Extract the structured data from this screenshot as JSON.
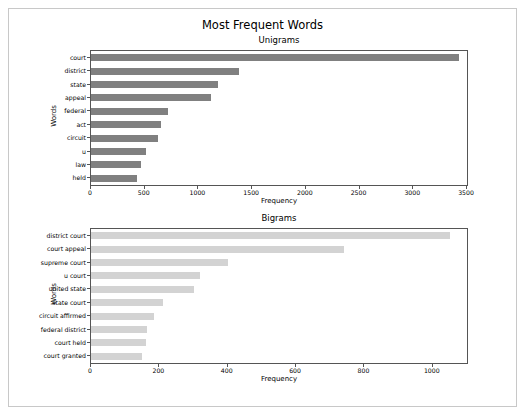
{
  "figure": {
    "suptitle": "Most Frequent Words"
  },
  "chart_data": [
    {
      "type": "bar",
      "orientation": "horizontal",
      "title": "Unigrams",
      "xlabel": "Frequency",
      "ylabel": "Words",
      "categories": [
        "court",
        "district",
        "state",
        "appeal",
        "federal",
        "act",
        "circuit",
        "u",
        "law",
        "held"
      ],
      "values": [
        3430,
        1380,
        1180,
        1120,
        720,
        650,
        620,
        510,
        470,
        430
      ],
      "xlim": [
        0,
        3500
      ],
      "xticks": [
        0,
        500,
        1000,
        1500,
        2000,
        2500,
        3000,
        3500
      ],
      "xticklabels": [
        "0",
        "500",
        "1000",
        "1500",
        "2000",
        "2500",
        "3000",
        "3500"
      ],
      "bar_color": "#808080",
      "grid": false,
      "legend": "none"
    },
    {
      "type": "bar",
      "orientation": "horizontal",
      "title": "Bigrams",
      "xlabel": "Frequency",
      "ylabel": "Words",
      "categories": [
        "district court",
        "court appeal",
        "supreme court",
        "u court",
        "united state",
        "state court",
        "circuit affirmed",
        "federal district",
        "court held",
        "court granted"
      ],
      "values": [
        1050,
        740,
        400,
        320,
        300,
        210,
        185,
        165,
        160,
        150
      ],
      "xlim": [
        0,
        1100
      ],
      "xticks": [
        0,
        200,
        400,
        600,
        800,
        1000
      ],
      "xticklabels": [
        "0",
        "200",
        "400",
        "600",
        "800",
        "1000"
      ],
      "bar_color": "#d3d3d3",
      "grid": false,
      "legend": "none"
    }
  ]
}
